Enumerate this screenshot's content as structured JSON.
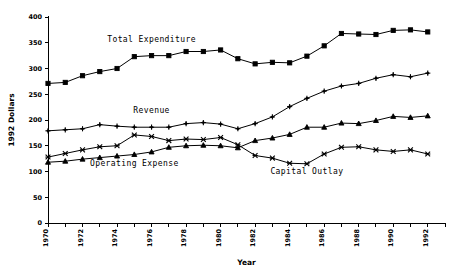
{
  "chart_data": {
    "type": "line",
    "title": "",
    "xlabel": "Year",
    "ylabel": "1992 Dollars",
    "xlim": [
      1970,
      1993
    ],
    "ylim": [
      0,
      400
    ],
    "yticks": [
      0,
      50,
      100,
      150,
      200,
      250,
      300,
      350,
      400
    ],
    "xticks": [
      1970,
      1971,
      1972,
      1973,
      1974,
      1975,
      1976,
      1977,
      1978,
      1979,
      1980,
      1981,
      1982,
      1983,
      1984,
      1985,
      1986,
      1987,
      1988,
      1989,
      1990,
      1991,
      1992,
      1993
    ],
    "xtick_labels": [
      "1970",
      "1972",
      "1974",
      "1976",
      "1978",
      "1980",
      "1982",
      "1984",
      "1986",
      "1988",
      "1990",
      "1992"
    ],
    "xtick_labels_years": [
      1970,
      1972,
      1974,
      1976,
      1978,
      1980,
      1982,
      1984,
      1986,
      1988,
      1990,
      1992
    ],
    "grid": false,
    "legend_position": "inline-annotations",
    "x": [
      1970,
      1971,
      1972,
      1973,
      1974,
      1975,
      1976,
      1977,
      1978,
      1979,
      1980,
      1981,
      1982,
      1983,
      1984,
      1985,
      1986,
      1987,
      1988,
      1989,
      1990,
      1991,
      1992
    ],
    "series": [
      {
        "name": "Total Expenditure",
        "marker": "square",
        "label_x": 1976,
        "label_y": 352,
        "values": [
          271,
          273,
          286,
          294,
          300,
          323,
          325,
          325,
          333,
          333,
          336,
          319,
          309,
          312,
          311,
          324,
          344,
          368,
          367,
          366,
          374,
          375,
          371
        ]
      },
      {
        "name": "Revenue",
        "marker": "plus",
        "label_x": 1976,
        "label_y": 213,
        "values": [
          179,
          181,
          183,
          191,
          188,
          186,
          186,
          186,
          193,
          195,
          192,
          183,
          193,
          206,
          226,
          242,
          256,
          266,
          271,
          281,
          288,
          284,
          291
        ]
      },
      {
        "name": "Operating Expense",
        "marker": "triangle",
        "label_x": 1975,
        "label_y": 110,
        "values": [
          118,
          120,
          124,
          127,
          130,
          133,
          138,
          147,
          150,
          151,
          150,
          146,
          160,
          165,
          172,
          186,
          186,
          194,
          193,
          199,
          207,
          205,
          208
        ]
      },
      {
        "name": "Capital Outlay",
        "marker": "x",
        "label_x": 1985,
        "label_y": 96,
        "values": [
          128,
          135,
          142,
          148,
          150,
          171,
          168,
          160,
          163,
          162,
          166,
          152,
          131,
          126,
          116,
          115,
          134,
          147,
          148,
          142,
          139,
          142,
          134
        ]
      }
    ]
  },
  "layout": {
    "plot_left": 48,
    "plot_right": 445,
    "plot_top": 17,
    "plot_bottom": 223,
    "xaxis_title_y": 265,
    "yaxis_title_x": 14
  }
}
